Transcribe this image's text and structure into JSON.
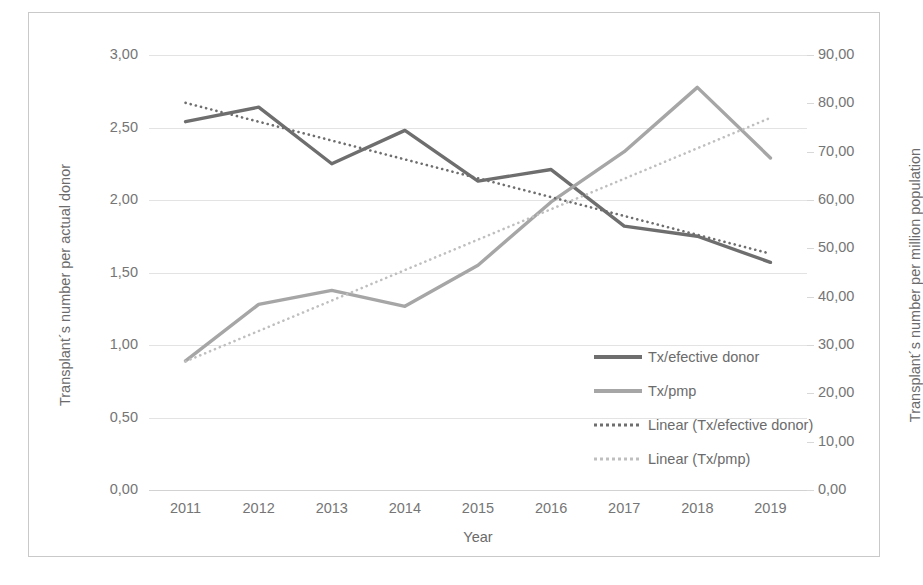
{
  "chart_data": {
    "type": "line",
    "title": "",
    "xlabel": "Year",
    "categories": [
      "2011",
      "2012",
      "2013",
      "2014",
      "2015",
      "2016",
      "2017",
      "2018",
      "2019"
    ],
    "left_axis": {
      "label": "Transplant´s number per actual donor",
      "ylim": [
        0,
        3
      ],
      "tick_step": 0.5,
      "ticks": [
        "0,00",
        "0,50",
        "1,00",
        "1,50",
        "2,00",
        "2,50",
        "3,00"
      ],
      "tick_values": [
        0,
        0.5,
        1,
        1.5,
        2,
        2.5,
        3
      ]
    },
    "right_axis": {
      "label": "Transplant´s number per million population",
      "ylim": [
        0,
        90
      ],
      "tick_step": 10,
      "ticks": [
        "0,00",
        "10,00",
        "20,00",
        "30,00",
        "40,00",
        "50,00",
        "60,00",
        "70,00",
        "80,00",
        "90,00"
      ],
      "tick_values": [
        0,
        10,
        20,
        30,
        40,
        50,
        60,
        70,
        80,
        90
      ]
    },
    "grid": true,
    "legend_position": "inside-right",
    "series": [
      {
        "name": "Tx/efective donor",
        "axis": "left",
        "style": "solid",
        "color": "#6e6e6e",
        "values": [
          2.54,
          2.64,
          2.25,
          2.48,
          2.13,
          2.21,
          1.82,
          1.75,
          1.57
        ]
      },
      {
        "name": "Tx/pmp",
        "axis": "right",
        "style": "solid",
        "color": "#a6a6a6",
        "values": [
          26.7,
          38.4,
          41.3,
          38.0,
          46.5,
          59.6,
          70.0,
          83.3,
          68.7
        ]
      },
      {
        "name": "Linear (Tx/efective donor)",
        "axis": "left",
        "style": "dotted",
        "color": "#6e6e6e",
        "trend": true,
        "endpoints": [
          2.67,
          1.63
        ]
      },
      {
        "name": "Linear (Tx/pmp)",
        "axis": "right",
        "style": "dotted",
        "color": "#bfbfbf",
        "trend": true,
        "endpoints": [
          26.6,
          77.0
        ]
      }
    ]
  },
  "legend": {
    "items": [
      {
        "label": "Tx/efective donor",
        "swatch": "sw-solid-dark"
      },
      {
        "label": "Tx/pmp",
        "swatch": "sw-solid-light"
      },
      {
        "label": "Linear (Tx/efective donor)",
        "swatch": "sw-dot-dark"
      },
      {
        "label": "Linear (Tx/pmp)",
        "swatch": "sw-dot-light"
      }
    ]
  }
}
